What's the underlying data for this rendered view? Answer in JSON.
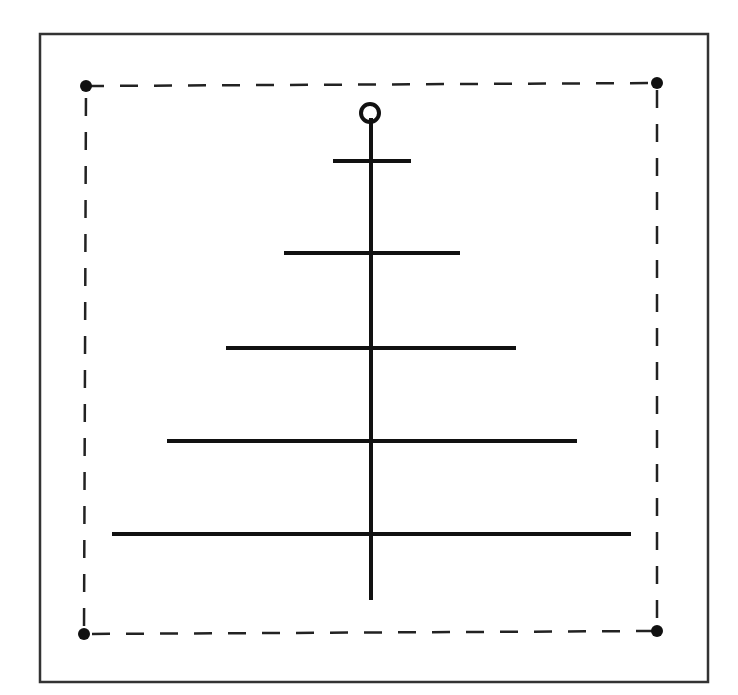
{
  "diagram": {
    "colors": {
      "background": "#ffffff",
      "ink": "#111111",
      "frame": "#333333"
    },
    "frame": {
      "x": 40,
      "y": 34,
      "width": 668,
      "height": 648
    },
    "dashed_square": {
      "corners": [
        {
          "name": "top-left",
          "x": 86,
          "y": 86
        },
        {
          "name": "top-right",
          "x": 657,
          "y": 83
        },
        {
          "name": "bottom-right",
          "x": 657,
          "y": 631
        },
        {
          "name": "bottom-left",
          "x": 84,
          "y": 634
        }
      ],
      "dot_radius": 6
    },
    "stem": {
      "x": 371,
      "y_top": 118,
      "y_bottom": 600
    },
    "top_circle": {
      "cx": 370,
      "cy": 113,
      "r": 9
    },
    "bars": [
      {
        "y": 161,
        "x1": 333,
        "x2": 411
      },
      {
        "y": 253,
        "x1": 284,
        "x2": 460
      },
      {
        "y": 348,
        "x1": 226,
        "x2": 516
      },
      {
        "y": 441,
        "x1": 167,
        "x2": 577
      },
      {
        "y": 534,
        "x1": 112,
        "x2": 631
      }
    ]
  }
}
